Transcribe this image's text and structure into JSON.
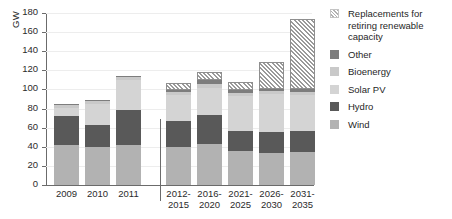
{
  "chart_data": {
    "type": "bar",
    "title": "",
    "xlabel": "",
    "ylabel": "GW",
    "ylim": [
      0,
      180
    ],
    "ytick_step": 20,
    "yticks": [
      0,
      20,
      40,
      60,
      80,
      100,
      120,
      140,
      160,
      180
    ],
    "grid": true,
    "stacked": true,
    "legend_position": "right",
    "categories": [
      "2009",
      "2010",
      "2011",
      "2012-2015",
      "2016-2020",
      "2021-2025",
      "2026-2030",
      "2031-2035"
    ],
    "series": [
      {
        "name": "Wind",
        "color": "#b2b2b2",
        "values": [
          42,
          40,
          42,
          40,
          43,
          36,
          34,
          35
        ]
      },
      {
        "name": "Hydro",
        "color": "#595959",
        "values": [
          30,
          23,
          36,
          27,
          30,
          21,
          21,
          22
        ]
      },
      {
        "name": "Solar PV",
        "color": "#d4d4d4",
        "values": [
          9,
          22,
          32,
          27,
          29,
          36,
          40,
          37
        ]
      },
      {
        "name": "Bioenergy",
        "color": "#c9c9c9",
        "values": [
          3,
          3,
          3,
          3,
          4,
          3,
          3,
          3
        ]
      },
      {
        "name": "Other",
        "color": "#7d7d7d",
        "values": [
          1,
          1,
          1,
          2,
          4,
          3,
          3,
          4
        ]
      },
      {
        "name": "Replacements for retiring renewable capacity",
        "color": "#dcdcdc",
        "hatched": true,
        "values": [
          0,
          0,
          0,
          8,
          8,
          9,
          28,
          73
        ]
      }
    ],
    "bar_totals": [
      85,
      89,
      114,
      107,
      118,
      108,
      129,
      174
    ],
    "group_separator_after": "2011"
  },
  "legend": {
    "items": [
      {
        "label": "Replacements for retiring renewable capacity",
        "swatch": "hatch-swatch"
      },
      {
        "label": "Other",
        "swatch": "other-swatch"
      },
      {
        "label": "Bioenergy",
        "swatch": "bioenergy-swatch"
      },
      {
        "label": "Solar PV",
        "swatch": "solar-pv-swatch"
      },
      {
        "label": "Hydro",
        "swatch": "hydro-swatch"
      },
      {
        "label": "Wind",
        "swatch": "wind-swatch"
      }
    ]
  }
}
